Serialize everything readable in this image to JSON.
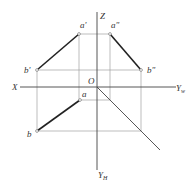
{
  "diagram": {
    "type": "three-view orthographic projection of line segment AB",
    "axes": {
      "x_label": "X",
      "z_label": "Z",
      "yw_label": "Y",
      "yw_sub": "w",
      "yh_label": "Y",
      "yh_sub": "H",
      "origin_label": "O"
    },
    "points": {
      "a_front": "a'",
      "a_side": "a\"",
      "b_front": "b'",
      "b_side": "b\"",
      "a_top": "a",
      "b_top": "b"
    },
    "colors": {
      "line": "#222222",
      "thin_line": "#9a9a9a",
      "axis": "#444444"
    }
  }
}
